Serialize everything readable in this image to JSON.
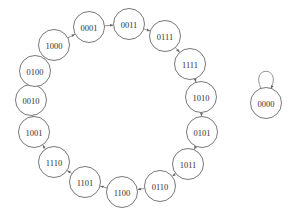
{
  "diagram": {
    "type": "state-transition-graph",
    "node_radius": 15.5,
    "colors": {
      "stroke": "#555555",
      "fill": "#ffffff",
      "text": "#333333",
      "edge": "#666666"
    },
    "nodes": [
      {
        "id": "0001",
        "label": "0001",
        "x": 89,
        "y": 27
      },
      {
        "id": "0011",
        "label": "0011",
        "x": 129,
        "y": 24
      },
      {
        "id": "0111",
        "label": "0111",
        "x": 165,
        "y": 36
      },
      {
        "id": "1111",
        "label": "1111",
        "x": 190,
        "y": 64
      },
      {
        "id": "1010",
        "label": "1010",
        "x": 201,
        "y": 97
      },
      {
        "id": "0101",
        "label": "0101",
        "x": 202,
        "y": 132
      },
      {
        "id": "1011",
        "label": "1011",
        "x": 188,
        "y": 164
      },
      {
        "id": "0110",
        "label": "0110",
        "x": 160,
        "y": 186
      },
      {
        "id": "1100",
        "label": "1100",
        "x": 122,
        "y": 192
      },
      {
        "id": "1101",
        "label": "1101",
        "x": 85,
        "y": 182
      },
      {
        "id": "1110",
        "label": "1110",
        "x": 54,
        "y": 162
      },
      {
        "id": "1001",
        "label": "1001",
        "x": 34,
        "y": 132
      },
      {
        "id": "0010",
        "label": "0010",
        "x": 31,
        "y": 100
      },
      {
        "id": "0100",
        "label": "0100",
        "x": 35,
        "y": 71
      },
      {
        "id": "1000",
        "label": "1000",
        "x": 54,
        "y": 45
      },
      {
        "id": "0000",
        "label": "0000",
        "x": 266,
        "y": 103
      }
    ],
    "edges": [
      {
        "from": "0001",
        "to": "0011"
      },
      {
        "from": "0011",
        "to": "0111"
      },
      {
        "from": "0111",
        "to": "1111"
      },
      {
        "from": "1111",
        "to": "1010"
      },
      {
        "from": "1010",
        "to": "0101"
      },
      {
        "from": "0101",
        "to": "1011"
      },
      {
        "from": "1011",
        "to": "0110"
      },
      {
        "from": "0110",
        "to": "1100"
      },
      {
        "from": "1100",
        "to": "1101"
      },
      {
        "from": "1101",
        "to": "1110"
      },
      {
        "from": "1110",
        "to": "1001"
      },
      {
        "from": "1001",
        "to": "0010"
      },
      {
        "from": "0010",
        "to": "0100"
      },
      {
        "from": "0100",
        "to": "1000"
      },
      {
        "from": "1000",
        "to": "0001"
      },
      {
        "from": "0000",
        "to": "0000"
      }
    ]
  }
}
